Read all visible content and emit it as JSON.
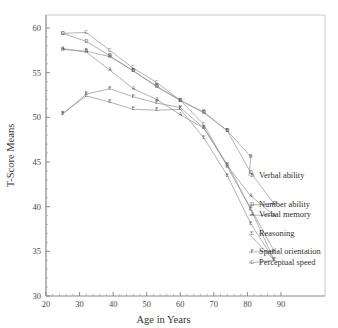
{
  "chart_data": {
    "type": "line",
    "title": "",
    "xlabel": "Age in Years",
    "ylabel": "T-Score Means",
    "xlim": [
      20,
      97
    ],
    "ylim": [
      30,
      60.7
    ],
    "xticks": [
      20,
      30,
      40,
      50,
      60,
      70,
      80,
      90
    ],
    "yticks": [
      30,
      35,
      40,
      45,
      50,
      55,
      60
    ],
    "xtick_labels": [
      "20",
      "30",
      "40",
      "50",
      "60",
      "70",
      "80",
      "90"
    ],
    "ytick_labels": [
      "30",
      "35",
      "40",
      "45",
      "50",
      "55",
      "60"
    ],
    "grid": false,
    "minor_ticks": true,
    "legend_position": "right-inside",
    "x": [
      25,
      32,
      39,
      46,
      53,
      60,
      67,
      74,
      81,
      88
    ],
    "series": [
      {
        "name": "Verbal ability",
        "glyph": "B",
        "values": [
          57.6,
          57.4,
          56.8,
          55.2,
          53.5,
          51.9,
          50.6,
          48.5,
          45.6,
          null
        ]
      },
      {
        "name": "Number ability",
        "glyph": "D",
        "values": [
          59.4,
          58.5,
          56.9,
          55.2,
          53.4,
          51.9,
          50.5,
          48.5,
          43.8,
          40.3
        ]
      },
      {
        "name": "Verbal memory",
        "glyph": "A",
        "values": [
          57.7,
          57.3,
          55.3,
          53.2,
          52.0,
          50.3,
          48.8,
          44.6,
          41.2,
          39.0
        ]
      },
      {
        "name": "Reasoning",
        "glyph": "E",
        "values": [
          50.4,
          52.4,
          51.7,
          50.9,
          50.8,
          50.9,
          47.7,
          43.5,
          38.1,
          34.0
        ]
      },
      {
        "name": "Spatial orientation",
        "glyph": "F",
        "values": [
          50.4,
          52.6,
          53.2,
          52.3,
          51.6,
          51.1,
          48.8,
          44.7,
          39.8,
          35.0
        ]
      },
      {
        "name": "Perceptual speed",
        "glyph": "C",
        "values": [
          59.4,
          59.5,
          57.5,
          55.5,
          53.9,
          51.9,
          49.2,
          44.5,
          39.7,
          34.0
        ]
      }
    ],
    "legend": [
      {
        "glyph": "B",
        "label": "Verbal ability"
      },
      {
        "glyph": "D",
        "label": "Number ability"
      },
      {
        "glyph": "A",
        "label": "Verbal memory"
      },
      {
        "glyph": "E",
        "label": "Reasoning"
      },
      {
        "glyph": "F",
        "label": "Spatial orientation"
      },
      {
        "glyph": "C",
        "label": "Perceptual speed"
      }
    ],
    "colors": {
      "line": "#909090",
      "axis": "#8a8a8a",
      "frame": "#c9c9c9",
      "text": "#2e2e2e",
      "background": "#ffffff"
    }
  }
}
